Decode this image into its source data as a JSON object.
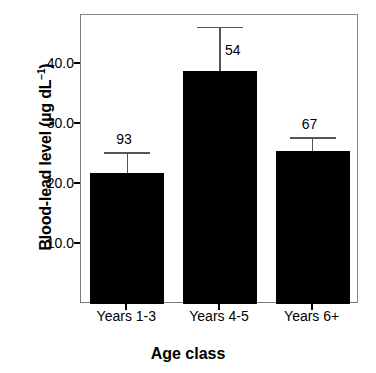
{
  "chart_data": {
    "type": "bar",
    "title": "",
    "xlabel": "Age class",
    "ylabel": "Blood-lead level (µg dL⁻¹)",
    "ylabel_text": "Blood-lead level (µg dL",
    "ylabel_sup": "−1",
    "ylabel_tail": ")",
    "categories": [
      "Years 1-3",
      "Years 4-5",
      "Years 6+"
    ],
    "values": [
      21.8,
      38.8,
      25.6
    ],
    "errors_upper": [
      25.3,
      46.2,
      27.8
    ],
    "annotations": [
      "93",
      "54",
      "67"
    ],
    "ylim": [
      0,
      48.2
    ],
    "ytick_values": [
      10.0,
      20.0,
      30.0,
      40.0
    ],
    "ytick_labels": [
      "10.0",
      "20.0",
      "30.0",
      "40.0"
    ],
    "grid": false,
    "legend": false,
    "bar_color": "#000000",
    "errorbar_color": "#555555",
    "frame_color": "#7a7a7a",
    "background": "#ffffff"
  }
}
